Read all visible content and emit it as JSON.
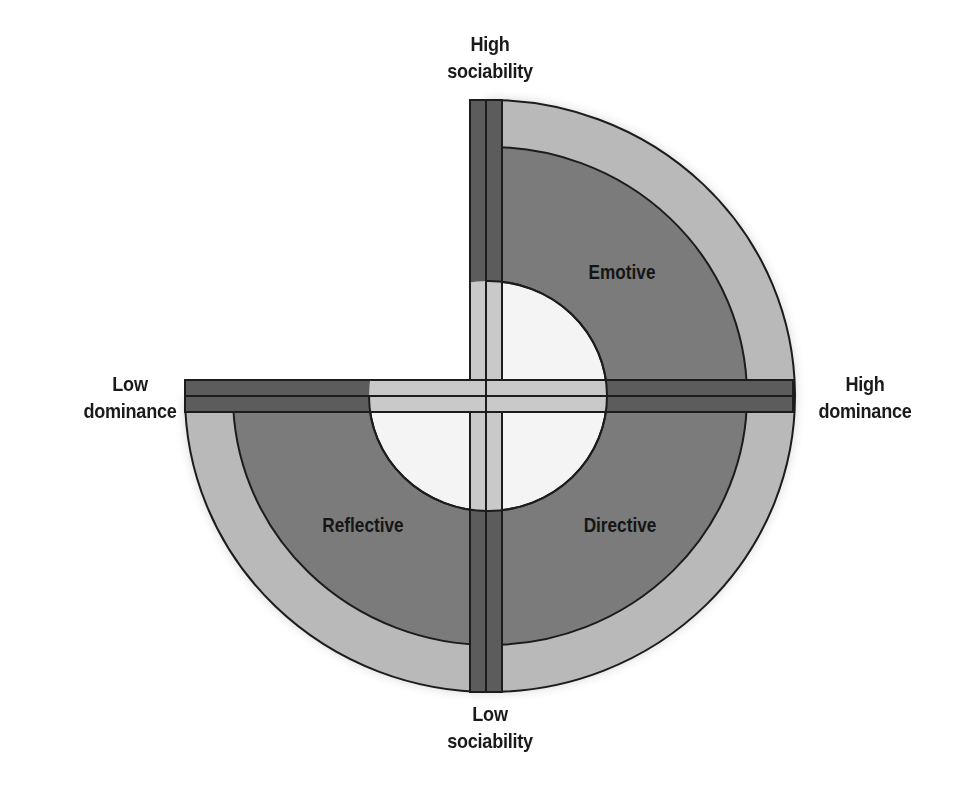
{
  "diagram": {
    "type": "social-style-quadrant",
    "axes": {
      "top": {
        "line1": "High",
        "line2": "sociability"
      },
      "bottom": {
        "line1": "Low",
        "line2": "sociability"
      },
      "left": {
        "line1": "Low",
        "line2": "dominance"
      },
      "right": {
        "line1": "High",
        "line2": "dominance"
      }
    },
    "quadrants": {
      "top_right": "Emotive",
      "bottom_right": "Directive",
      "bottom_left": "Reflective",
      "top_left": ""
    },
    "colors": {
      "outer_ring": "#b9b9b9",
      "inner_ring": "#7b7b7b",
      "bar": "#5c5c5c",
      "cross_inner": "#c9c9c9",
      "hole": "#f4f4f4",
      "stroke": "#1c1c1c"
    }
  }
}
